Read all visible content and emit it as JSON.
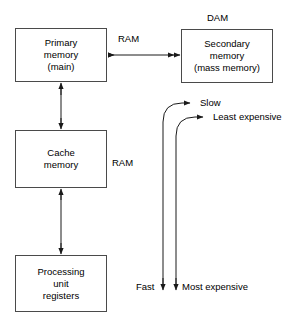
{
  "diagram": {
    "stroke_color": "#4a4a4a",
    "text_color": "#000000",
    "background_color": "#ffffff",
    "boxes": [
      {
        "id": "primary-memory",
        "lines": [
          "Primary",
          "memory",
          "(main)"
        ],
        "line1": "Primary",
        "line2": "memory",
        "line3": "(main)"
      },
      {
        "id": "secondary-memory",
        "lines": [
          "Secondary",
          "memory",
          "(mass memory)"
        ],
        "line1": "Secondary",
        "line2": "memory",
        "line3": "(mass memory)"
      },
      {
        "id": "cache-memory",
        "lines": [
          "Cache",
          "memory"
        ],
        "line1": "Cache",
        "line2": "memory"
      },
      {
        "id": "processing-unit-registers",
        "lines": [
          "Processing",
          "unit",
          "registers"
        ],
        "line1": "Processing",
        "line2": "unit",
        "line3": "registers"
      }
    ],
    "labels": {
      "dam": "DAM",
      "ram_top": "RAM",
      "ram_middle": "RAM",
      "slow": "Slow",
      "least_expensive": "Least expensive",
      "fast": "Fast",
      "most_expensive": "Most expensive"
    },
    "connectors": [
      {
        "id": "primary-secondary",
        "kind": "double-arrow-horizontal",
        "label": "RAM"
      },
      {
        "id": "primary-cache",
        "kind": "double-arrow-vertical",
        "label": ""
      },
      {
        "id": "cache-cpu",
        "kind": "double-arrow-vertical",
        "label": ""
      },
      {
        "id": "speed-axis",
        "kind": "curved-double-arrow",
        "top_label": "Slow",
        "bottom_label": "Fast"
      },
      {
        "id": "cost-axis",
        "kind": "curved-double-arrow",
        "top_label": "Least expensive",
        "bottom_label": "Most expensive"
      }
    ]
  }
}
